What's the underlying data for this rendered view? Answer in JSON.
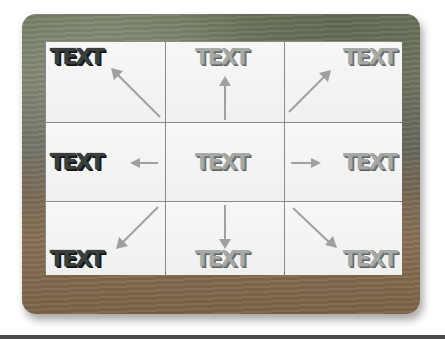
{
  "diagram": {
    "title": "",
    "center_label": "TEXT",
    "cells": [
      {
        "position": "top-left",
        "label": "TEXT",
        "style": "dark",
        "arrow_direction": "up-left"
      },
      {
        "position": "top-center",
        "label": "TEXT",
        "style": "light",
        "arrow_direction": "up"
      },
      {
        "position": "top-right",
        "label": "TEXT",
        "style": "light",
        "arrow_direction": "up-right"
      },
      {
        "position": "middle-left",
        "label": "TEXT",
        "style": "dark",
        "arrow_direction": "left"
      },
      {
        "position": "center",
        "label": "TEXT",
        "style": "light",
        "arrow_direction": "none"
      },
      {
        "position": "middle-right",
        "label": "TEXT",
        "style": "light",
        "arrow_direction": "right"
      },
      {
        "position": "bottom-left",
        "label": "TEXT",
        "style": "dark",
        "arrow_direction": "down-left"
      },
      {
        "position": "bottom-center",
        "label": "TEXT",
        "style": "light",
        "arrow_direction": "down"
      },
      {
        "position": "bottom-right",
        "label": "TEXT",
        "style": "light",
        "arrow_direction": "down-right"
      }
    ],
    "colors": {
      "grid_line": "#8a8a8a",
      "cell_background": "#f4f4f4",
      "arrow": "#a0a0a0",
      "text_dark": "#3a3f3c",
      "text_light": "#a6aaa6",
      "board_stone": "#6f7a5e",
      "board_wood": "#7c6448"
    }
  }
}
